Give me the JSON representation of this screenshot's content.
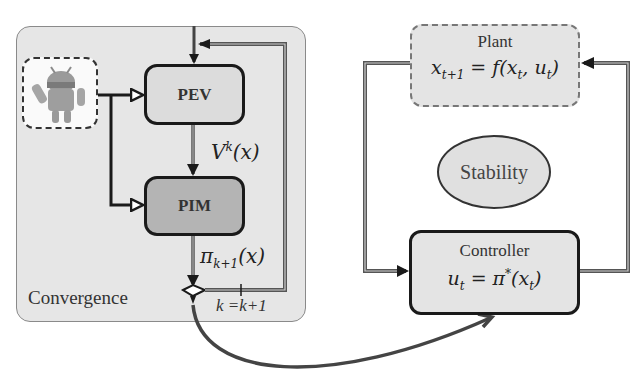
{
  "left_panel": {
    "region_label": "Convergence",
    "agent_icon": "android-robot-icon",
    "blocks": [
      {
        "id": "pev",
        "label": "PEV"
      },
      {
        "id": "pim",
        "label": "PIM"
      }
    ],
    "edge_labels": {
      "value_function": "V",
      "value_function_sup": "k",
      "value_function_arg": "(x)",
      "policy": "π",
      "policy_sub": "k+1",
      "policy_arg": "(x)",
      "iteration_update": "k =k+1"
    }
  },
  "right_panel": {
    "plant": {
      "title": "Plant",
      "equation": "x_{t+1} = f(x_t, u_t)",
      "eq_main": "x",
      "eq_sub": "t+1",
      "eq_rest": " = f(x",
      "eq_sub2": "t",
      "eq_rest2": ", u",
      "eq_sub3": "t",
      "eq_end": ")"
    },
    "stability": {
      "label": "Stability"
    },
    "controller": {
      "title": "Controller",
      "eq_main": "u",
      "eq_sub": "t",
      "eq_rest": " = π",
      "eq_sup": "*",
      "eq_rest2": "(x",
      "eq_sub2": "t",
      "eq_end": ")"
    }
  },
  "colors": {
    "convergence_bg": "#e6e6e6",
    "pev_fill": "#dcdcdc",
    "pim_fill": "#b4b4b4",
    "plant_fill": "#e4e4e4",
    "controller_fill": "#e4e4e4",
    "stability_fill": "#e0e0e0",
    "line": "#1a1a1a"
  }
}
